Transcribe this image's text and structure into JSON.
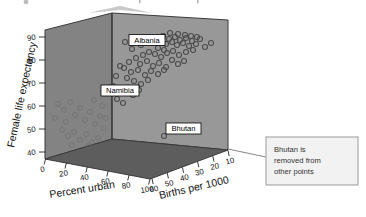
{
  "chart_data": {
    "type": "scatter",
    "title": "",
    "projection": "3d-scatterplot",
    "xlabel": "Percent urban",
    "zlabel": "Births per 1000",
    "ylabel": "Female life expectancy",
    "xticks": [
      "0",
      "20",
      "40",
      "60",
      "80",
      "100"
    ],
    "zticks": [
      "60",
      "50",
      "40",
      "30",
      "20",
      "10"
    ],
    "yticks": [
      "90",
      "80",
      "70",
      "60",
      "50",
      "40"
    ],
    "xlim": [
      0,
      100
    ],
    "ylim": [
      40,
      90
    ],
    "zlim": [
      60,
      10
    ],
    "grid": false,
    "legend": "none",
    "marker": "open-circle",
    "point_labels": [
      {
        "text": "Albania",
        "x": 55,
        "y": 80,
        "z": 23
      },
      {
        "text": "Namibia",
        "x": 30,
        "y": 63,
        "z": 43
      },
      {
        "text": "Bhutan",
        "x": 6,
        "y": 47,
        "z": 40
      }
    ],
    "annotations": [
      {
        "text_lines": [
          "Bhutan is",
          "removed from",
          "other points"
        ],
        "points_to": "Bhutan"
      }
    ],
    "points": [
      {
        "px": 125,
        "py": 42
      },
      {
        "px": 132,
        "py": 49
      },
      {
        "px": 141,
        "py": 45
      },
      {
        "px": 147,
        "py": 40
      },
      {
        "px": 152,
        "py": 43
      },
      {
        "px": 156,
        "py": 38
      },
      {
        "px": 160,
        "py": 41
      },
      {
        "px": 163,
        "py": 36
      },
      {
        "px": 166,
        "py": 44
      },
      {
        "px": 169,
        "py": 39
      },
      {
        "px": 172,
        "py": 42
      },
      {
        "px": 175,
        "py": 37
      },
      {
        "px": 177,
        "py": 45
      },
      {
        "px": 180,
        "py": 40
      },
      {
        "px": 183,
        "py": 43
      },
      {
        "px": 186,
        "py": 38
      },
      {
        "px": 189,
        "py": 46
      },
      {
        "px": 192,
        "py": 41
      },
      {
        "px": 196,
        "py": 44
      },
      {
        "px": 200,
        "py": 39
      },
      {
        "px": 205,
        "py": 47
      },
      {
        "px": 211,
        "py": 43
      },
      {
        "px": 170,
        "py": 33
      },
      {
        "px": 178,
        "py": 34
      },
      {
        "px": 185,
        "py": 35
      },
      {
        "px": 191,
        "py": 36
      },
      {
        "px": 197,
        "py": 37
      },
      {
        "px": 158,
        "py": 48
      },
      {
        "px": 164,
        "py": 50
      },
      {
        "px": 149,
        "py": 52
      },
      {
        "px": 143,
        "py": 55
      },
      {
        "px": 155,
        "py": 54
      },
      {
        "px": 161,
        "py": 57
      },
      {
        "px": 167,
        "py": 53
      },
      {
        "px": 173,
        "py": 51
      },
      {
        "px": 179,
        "py": 55
      },
      {
        "px": 186,
        "py": 52
      },
      {
        "px": 193,
        "py": 50
      },
      {
        "px": 136,
        "py": 58
      },
      {
        "px": 129,
        "py": 62
      },
      {
        "px": 140,
        "py": 64
      },
      {
        "px": 147,
        "py": 61
      },
      {
        "px": 153,
        "py": 66
      },
      {
        "px": 159,
        "py": 63
      },
      {
        "px": 166,
        "py": 67
      },
      {
        "px": 172,
        "py": 60
      },
      {
        "px": 178,
        "py": 64
      },
      {
        "px": 184,
        "py": 61
      },
      {
        "px": 124,
        "py": 68
      },
      {
        "px": 131,
        "py": 72
      },
      {
        "px": 138,
        "py": 70
      },
      {
        "px": 145,
        "py": 75
      },
      {
        "px": 151,
        "py": 71
      },
      {
        "px": 158,
        "py": 74
      },
      {
        "px": 164,
        "py": 70
      },
      {
        "px": 127,
        "py": 78
      },
      {
        "px": 134,
        "py": 81
      },
      {
        "px": 141,
        "py": 84
      },
      {
        "px": 148,
        "py": 80
      },
      {
        "px": 119,
        "py": 88
      },
      {
        "px": 126,
        "py": 92
      },
      {
        "px": 133,
        "py": 95
      },
      {
        "px": 139,
        "py": 90
      },
      {
        "px": 117,
        "py": 99
      },
      {
        "px": 123,
        "py": 103
      },
      {
        "px": 113,
        "py": 86
      },
      {
        "px": 116,
        "py": 76
      },
      {
        "px": 120,
        "py": 66
      },
      {
        "px": 164,
        "py": 136
      }
    ],
    "wall_points": [
      {
        "px": 58,
        "py": 104
      },
      {
        "px": 64,
        "py": 110
      },
      {
        "px": 70,
        "py": 102
      },
      {
        "px": 75,
        "py": 115
      },
      {
        "px": 80,
        "py": 108
      },
      {
        "px": 85,
        "py": 120
      },
      {
        "px": 90,
        "py": 112
      },
      {
        "px": 95,
        "py": 124
      },
      {
        "px": 100,
        "py": 116
      },
      {
        "px": 104,
        "py": 128
      },
      {
        "px": 62,
        "py": 130
      },
      {
        "px": 68,
        "py": 136
      },
      {
        "px": 74,
        "py": 132
      },
      {
        "px": 80,
        "py": 140
      },
      {
        "px": 86,
        "py": 134
      },
      {
        "px": 92,
        "py": 142
      },
      {
        "px": 98,
        "py": 138
      },
      {
        "px": 66,
        "py": 122
      },
      {
        "px": 72,
        "py": 145
      },
      {
        "px": 88,
        "py": 146
      },
      {
        "px": 55,
        "py": 118
      },
      {
        "px": 102,
        "py": 106
      },
      {
        "px": 106,
        "py": 118
      },
      {
        "px": 94,
        "py": 100
      }
    ]
  },
  "colors": {
    "left_wall": "#838383",
    "right_wall": "#989898",
    "floor": "#5d5d5d",
    "edge": "#3a3a3a",
    "marker_stroke": "#4a4a4a",
    "annot_border": "#9a9a9a",
    "annot_fill": "#f2f2f2",
    "leader": "#777777"
  }
}
